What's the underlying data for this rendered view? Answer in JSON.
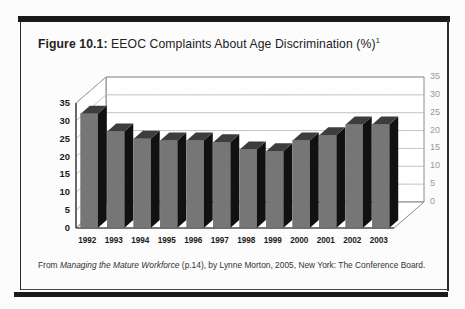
{
  "figure": {
    "label": "Figure 10.1:",
    "title": "EEOC Complaints About Age Discrimination (%)",
    "footnote_marker": "1"
  },
  "source_caption": {
    "prefix": "From ",
    "work_title": "Managing the Mature Workforce",
    "suffix": " (p.14), by Lynne Morton, 2005, New York:  The Conference Board."
  },
  "colors": {
    "bar_front": "#767676",
    "bar_side": "#111111",
    "bar_top": "#3d3d3d",
    "frame": "#1a1a1a",
    "gridline": "#b4b4b4",
    "axis_left_text": "#1b1b1b",
    "axis_right_text": "#9a9a9a",
    "plot_background": "#ffffff"
  },
  "chart_data": {
    "type": "bar",
    "title": "EEOC Complaints About Age Discrimination (%)",
    "xlabel": "",
    "ylabel": "",
    "categories": [
      "1992",
      "1993",
      "1994",
      "1995",
      "1996",
      "1997",
      "1998",
      "1999",
      "2000",
      "2001",
      "2002",
      "2003"
    ],
    "values": [
      32,
      27,
      25,
      24.5,
      24.5,
      24,
      22,
      21.5,
      24.5,
      26,
      29,
      29
    ],
    "ylim": [
      0,
      35
    ],
    "yticks": [
      0,
      5,
      10,
      15,
      20,
      25,
      30,
      35
    ],
    "yticks_left": [
      "0",
      "5",
      "10",
      "15",
      "20",
      "25",
      "30",
      "35"
    ],
    "yticks_right": [
      "0",
      "5",
      "10",
      "15",
      "20",
      "25",
      "30",
      "35"
    ],
    "grid": true,
    "legend": false,
    "legend_position": "none",
    "style": "3d-column",
    "note": "Percentage of EEOC complaints that were age discrimination claims, by year."
  }
}
